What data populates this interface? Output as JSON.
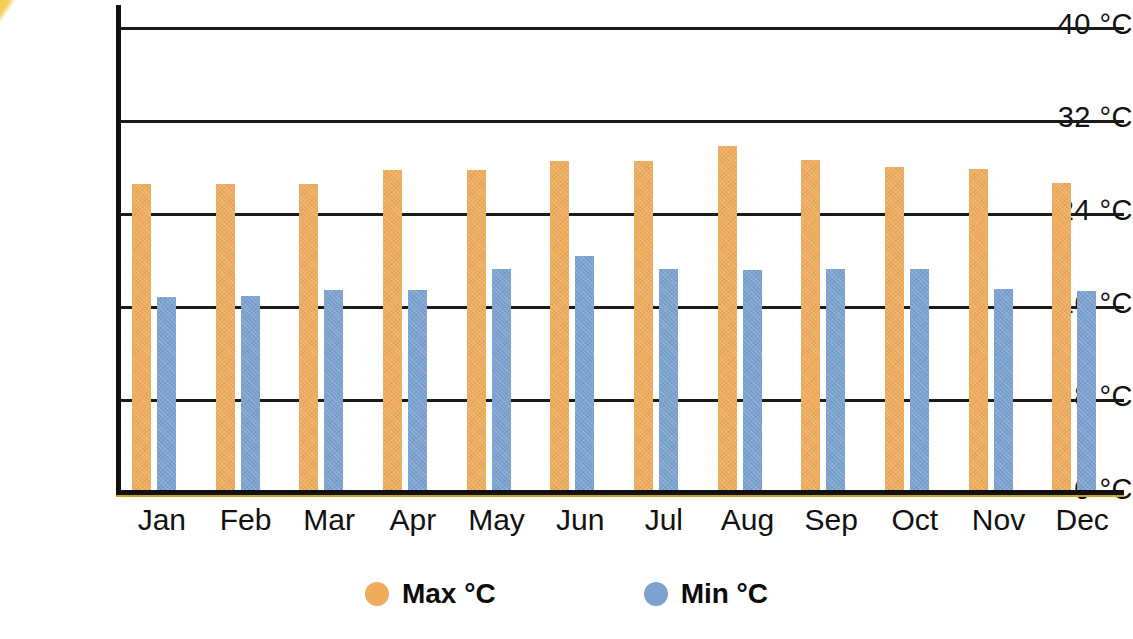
{
  "chart_data": {
    "type": "bar",
    "title": "",
    "xlabel": "",
    "ylabel": "",
    "categories": [
      "Jan",
      "Feb",
      "Mar",
      "Apr",
      "May",
      "Jun",
      "Jul",
      "Aug",
      "Sep",
      "Oct",
      "Nov",
      "Dec"
    ],
    "series": [
      {
        "name": "Max °C",
        "color": "#eeac5c",
        "values": [
          26.5,
          26.5,
          26.5,
          27.7,
          27.7,
          28.5,
          28.5,
          29.8,
          28.6,
          28.0,
          27.8,
          26.6
        ]
      },
      {
        "name": "Min °C",
        "color": "#7ba2d0",
        "values": [
          16.8,
          16.9,
          17.4,
          17.4,
          19.2,
          20.3,
          19.2,
          19.1,
          19.2,
          19.2,
          17.5,
          17.3
        ]
      }
    ],
    "ylim": [
      0,
      40
    ],
    "yticks": [
      0,
      8,
      16,
      24,
      32,
      40
    ],
    "ytick_labels": [
      "0 °C",
      "8 °C",
      "16 °C",
      "24 °C",
      "32 °C",
      "40 °C"
    ],
    "grid": true,
    "legend_position": "bottom",
    "unit": "°C"
  },
  "legend": {
    "items": [
      {
        "label": "Max °C",
        "swatch": "orange-circle-swatch",
        "color": "#eeac5c"
      },
      {
        "label": "Min °C",
        "swatch": "blue-circle-swatch",
        "color": "#7ba2d0"
      }
    ]
  },
  "colors": {
    "max_bar": "#eeac5c",
    "min_bar": "#7ba2d0",
    "axis": "#111111",
    "grid": "#1a1a1a",
    "corner_wedge": "#f0c23c",
    "background": "#ffffff"
  }
}
